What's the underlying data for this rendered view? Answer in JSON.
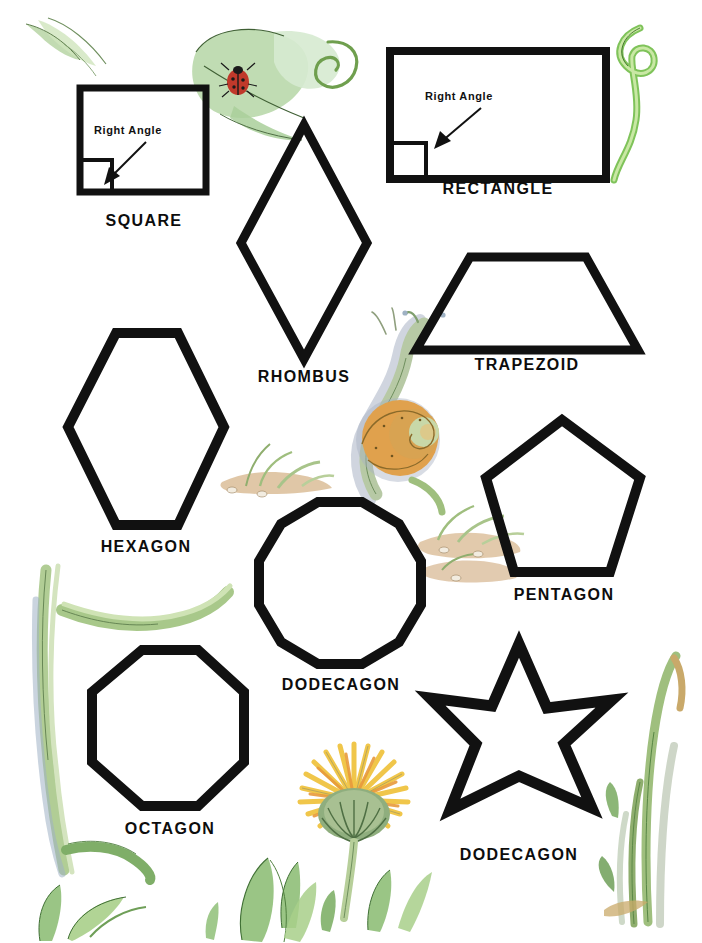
{
  "page": {
    "background_color": "#ffffff",
    "ink_color": "#111111",
    "width": 702,
    "height": 943
  },
  "shapes": [
    {
      "id": "square",
      "label": "SQUARE",
      "sides": 4,
      "annotation": "Right Angle",
      "has_right_angle_marker": true
    },
    {
      "id": "rectangle",
      "label": "RECTANGLE",
      "sides": 4,
      "annotation": "Right Angle",
      "has_right_angle_marker": true
    },
    {
      "id": "rhombus",
      "label": "RHOMBUS",
      "sides": 4,
      "annotation": "",
      "has_right_angle_marker": false
    },
    {
      "id": "trapezoid",
      "label": "TRAPEZOID",
      "sides": 4,
      "annotation": "",
      "has_right_angle_marker": false
    },
    {
      "id": "hexagon",
      "label": "HEXAGON",
      "sides": 6,
      "annotation": "",
      "has_right_angle_marker": false
    },
    {
      "id": "pentagon",
      "label": "PENTAGON",
      "sides": 5,
      "annotation": "",
      "has_right_angle_marker": false
    },
    {
      "id": "dodecagon",
      "label": "DODECAGON",
      "sides": 12,
      "annotation": "",
      "has_right_angle_marker": false
    },
    {
      "id": "octagon",
      "label": "OCTAGON",
      "sides": 8,
      "annotation": "",
      "has_right_angle_marker": false
    },
    {
      "id": "dodecagon-star",
      "label": "DODECAGON",
      "sides": 12,
      "annotation": "",
      "has_right_angle_marker": false
    }
  ],
  "decorations": [
    {
      "id": "leaf-tendril-topleft",
      "name": "leaf-sprig-illustration",
      "palette": [
        "#a9cf9a",
        "#d8e8c9",
        "#6f8f5e"
      ]
    },
    {
      "id": "ladybug-leaf",
      "name": "ladybug-on-leaf-illustration",
      "palette": [
        "#b9d8ab",
        "#d9ead0",
        "#c0392b",
        "#1a1a1a"
      ]
    },
    {
      "id": "vine-tendril-topright",
      "name": "curling-vine-illustration",
      "palette": [
        "#8fd06a",
        "#c9e8a4",
        "#5f8f3e"
      ]
    },
    {
      "id": "snail",
      "name": "snail-illustration",
      "palette": [
        "#e09a45",
        "#c8872f",
        "#b9c7b0",
        "#a9b2c4"
      ]
    },
    {
      "id": "sand-sprouts-left",
      "name": "sprouts-in-sand-illustration",
      "palette": [
        "#d9b88a",
        "#c9a46f",
        "#a8c48a"
      ]
    },
    {
      "id": "sand-sprouts-right",
      "name": "sprouts-in-sand-illustration",
      "palette": [
        "#d9b88a",
        "#c9a46f",
        "#a8c48a"
      ]
    },
    {
      "id": "grass-left",
      "name": "arching-grass-illustration",
      "palette": [
        "#a8c88a",
        "#8fae6e",
        "#9fb0c4"
      ]
    },
    {
      "id": "dandelion",
      "name": "dandelion-flower-illustration",
      "palette": [
        "#f2c94c",
        "#e8a33d",
        "#7fa06a",
        "#5f8050"
      ]
    },
    {
      "id": "grass-bottom-left",
      "name": "grass-leaves-illustration",
      "palette": [
        "#8fbf78",
        "#6f9f58"
      ]
    },
    {
      "id": "grass-bottom-center",
      "name": "grass-leaves-illustration",
      "palette": [
        "#8fbf78",
        "#6f9f58"
      ]
    },
    {
      "id": "grass-right",
      "name": "upright-grass-illustration",
      "palette": [
        "#8fbf78",
        "#c9a96a",
        "#b9c4b0"
      ]
    }
  ]
}
